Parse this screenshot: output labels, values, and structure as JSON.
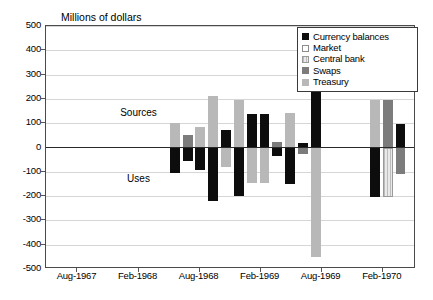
{
  "chart_data": {
    "type": "bar",
    "title": "Millions of dollars",
    "xlabel": "",
    "ylabel": "Millions of dollars",
    "ylim": [
      -500,
      500
    ],
    "ytick_values": [
      500,
      400,
      300,
      200,
      100,
      0,
      -100,
      -200,
      -300,
      -400,
      -500
    ],
    "ytick_labels": [
      "500",
      "400",
      "300",
      "200",
      "100",
      "0",
      "-100",
      "-200",
      "-300",
      "-400",
      "-500"
    ],
    "xtick_labels": [
      "Aug-1967",
      "Feb-1968",
      "Aug-1968",
      "Feb-1969",
      "Aug-1969",
      "Feb-1970"
    ],
    "xtick_positions_pct": [
      8.5,
      25.0,
      41.5,
      58.0,
      74.5,
      91.0
    ],
    "grid": true,
    "legend_position": "top-right",
    "zero_reference_line": true,
    "annotations": [
      {
        "text": "Sources",
        "value_region": "above-zero",
        "x_pct": 25.0,
        "y_value": 140
      },
      {
        "text": "Uses",
        "value_region": "below-zero",
        "x_pct": 25.0,
        "y_value": -130
      }
    ],
    "series": [
      {
        "name": "Currency balances",
        "color": "#0d0d0d",
        "swatch": "solid-black"
      },
      {
        "name": "Market",
        "color": "#ffffff",
        "swatch": "open-white"
      },
      {
        "name": "Central bank",
        "color": "#e9e9e9",
        "swatch": "hatched-light"
      },
      {
        "name": "Swaps",
        "color": "#7c7c7c",
        "swatch": "solid-medium-gray"
      },
      {
        "name": "Treasury",
        "color": "#b8b8b8",
        "swatch": "solid-light-gray"
      }
    ],
    "bars": [
      {
        "series": "Treasury",
        "x_pct": 33.5,
        "width_pct": 2.6,
        "y_top": 100,
        "y_bottom": 0
      },
      {
        "series": "Currency balances",
        "x_pct": 33.5,
        "width_pct": 2.6,
        "y_top": 0,
        "y_bottom": -103
      },
      {
        "series": "Swaps",
        "x_pct": 37.0,
        "width_pct": 2.6,
        "y_top": 50,
        "y_bottom": 0
      },
      {
        "series": "Currency balances",
        "x_pct": 37.0,
        "width_pct": 2.6,
        "y_top": 0,
        "y_bottom": -57
      },
      {
        "series": "Treasury",
        "x_pct": 40.4,
        "width_pct": 2.6,
        "y_top": 83,
        "y_bottom": 0
      },
      {
        "series": "Currency balances",
        "x_pct": 40.4,
        "width_pct": 2.6,
        "y_top": 0,
        "y_bottom": -92
      },
      {
        "series": "Treasury",
        "x_pct": 43.9,
        "width_pct": 2.6,
        "y_top": 213,
        "y_bottom": 0
      },
      {
        "series": "Currency balances",
        "x_pct": 43.9,
        "width_pct": 2.6,
        "y_top": 0,
        "y_bottom": -220
      },
      {
        "series": "Currency balances",
        "x_pct": 47.4,
        "width_pct": 2.6,
        "y_top": 71,
        "y_bottom": 0
      },
      {
        "series": "Treasury",
        "x_pct": 47.4,
        "width_pct": 2.6,
        "y_top": 0,
        "y_bottom": -79
      },
      {
        "series": "Treasury",
        "x_pct": 50.8,
        "width_pct": 2.6,
        "y_top": 196,
        "y_bottom": 0
      },
      {
        "series": "Currency balances",
        "x_pct": 50.8,
        "width_pct": 2.6,
        "y_top": 0,
        "y_bottom": -201
      },
      {
        "series": "Currency balances",
        "x_pct": 54.3,
        "width_pct": 2.6,
        "y_top": 137,
        "y_bottom": 0
      },
      {
        "series": "Treasury",
        "x_pct": 54.3,
        "width_pct": 2.6,
        "y_top": 0,
        "y_bottom": -148
      },
      {
        "series": "Currency balances",
        "x_pct": 57.8,
        "width_pct": 2.6,
        "y_top": 137,
        "y_bottom": 0
      },
      {
        "series": "Treasury",
        "x_pct": 57.8,
        "width_pct": 2.6,
        "y_top": 0,
        "y_bottom": -148
      },
      {
        "series": "Swaps",
        "x_pct": 61.2,
        "width_pct": 2.6,
        "y_top": 22,
        "y_bottom": 0
      },
      {
        "series": "Currency balances",
        "x_pct": 61.2,
        "width_pct": 2.6,
        "y_top": 0,
        "y_bottom": -33
      },
      {
        "series": "Treasury",
        "x_pct": 64.7,
        "width_pct": 2.6,
        "y_top": 141,
        "y_bottom": 0
      },
      {
        "series": "Currency balances",
        "x_pct": 64.7,
        "width_pct": 2.6,
        "y_top": 0,
        "y_bottom": -150
      },
      {
        "series": "Currency balances",
        "x_pct": 68.2,
        "width_pct": 2.6,
        "y_top": 20,
        "y_bottom": 0
      },
      {
        "series": "Swaps",
        "x_pct": 68.2,
        "width_pct": 2.6,
        "y_top": 0,
        "y_bottom": -28
      },
      {
        "series": "Currency balances",
        "x_pct": 71.6,
        "width_pct": 2.6,
        "y_top": 434,
        "y_bottom": 0
      },
      {
        "series": "Treasury",
        "x_pct": 71.6,
        "width_pct": 2.6,
        "y_top": 0,
        "y_bottom": -449
      },
      {
        "series": "Treasury",
        "x_pct": 87.6,
        "width_pct": 2.6,
        "y_top": 196,
        "y_bottom": 0
      },
      {
        "series": "Currency balances",
        "x_pct": 87.6,
        "width_pct": 2.6,
        "y_top": 0,
        "y_bottom": -202
      },
      {
        "series": "Swaps",
        "x_pct": 91.1,
        "width_pct": 2.6,
        "y_top": 196,
        "y_bottom": 0
      },
      {
        "series": "Central bank",
        "x_pct": 91.1,
        "width_pct": 2.6,
        "y_top": 0,
        "y_bottom": -203
      },
      {
        "series": "Currency balances",
        "x_pct": 94.5,
        "width_pct": 2.6,
        "y_top": 96,
        "y_bottom": 0
      },
      {
        "series": "Swaps",
        "x_pct": 94.5,
        "width_pct": 2.6,
        "y_top": 0,
        "y_bottom": -108
      }
    ]
  },
  "legend": {
    "items": [
      {
        "label": "Currency balances"
      },
      {
        "label": "Market"
      },
      {
        "label": "Central bank"
      },
      {
        "label": "Swaps"
      },
      {
        "label": "Treasury"
      }
    ]
  }
}
